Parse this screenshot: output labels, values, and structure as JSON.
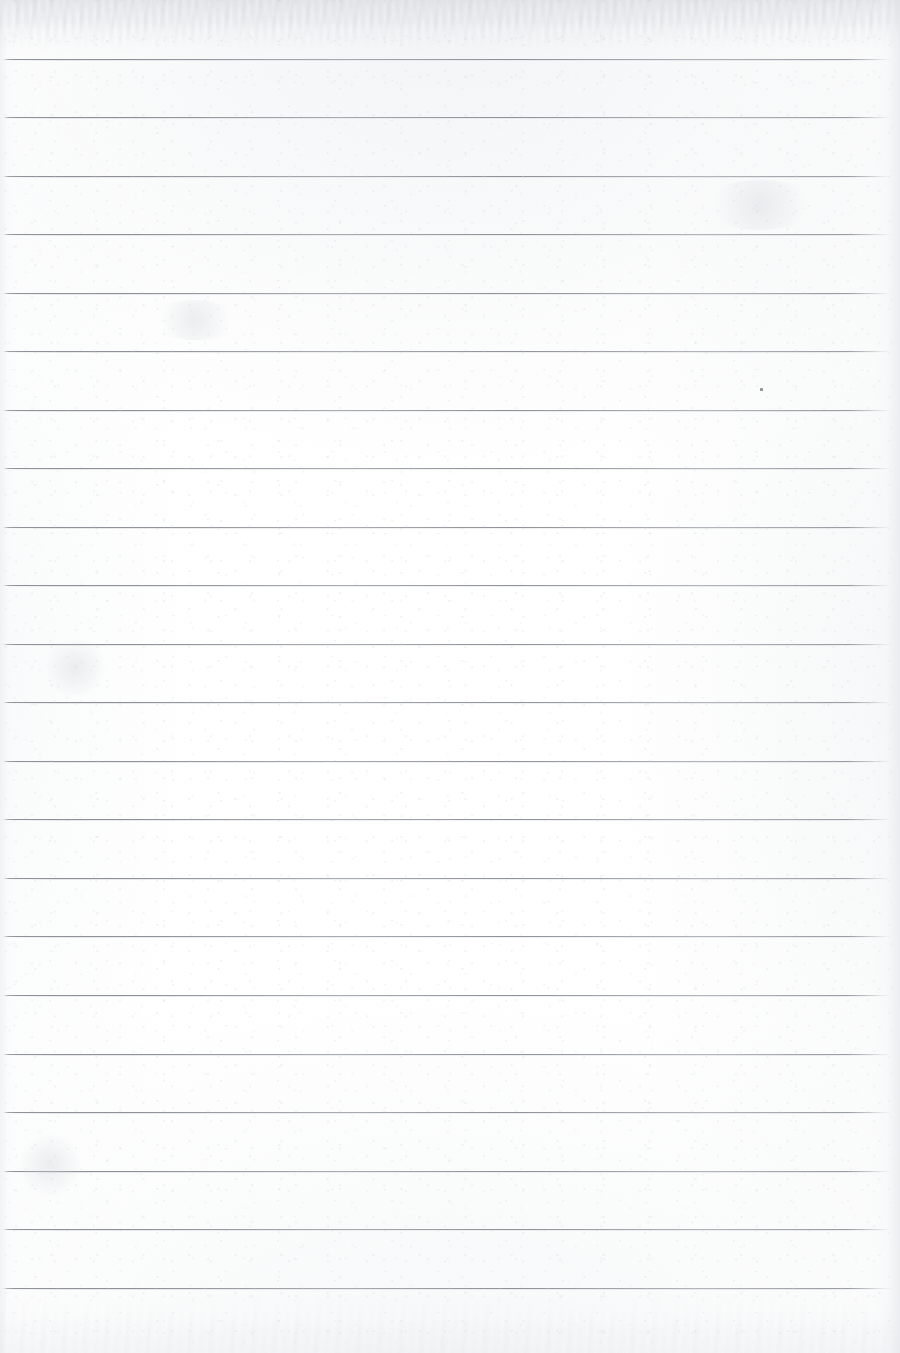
{
  "document": {
    "kind": "scanned-lined-notebook-page",
    "title": "Blank Ruled Notebook Page",
    "content_text": "",
    "has_handwriting": false,
    "has_margin_rule": false,
    "page_width": 900,
    "page_height": 1353
  },
  "colors": {
    "paper": "#ffffff",
    "rule_line": "#82868c",
    "rule_line_soft": "#cdd0d5",
    "edge_shadow": "#dde0e4",
    "speck": "#767a80"
  },
  "ruling": {
    "line_count": 22,
    "first_line_y": 59,
    "line_spacing": 58.5,
    "line_thickness": 1,
    "line_start_x": 3,
    "line_end_x": 892,
    "note": "horizontal ruled lines only; no vertical margin rule"
  },
  "lines": [
    {
      "index": 1,
      "y": 59,
      "x1": 3,
      "x2": 892
    },
    {
      "index": 2,
      "y": 117,
      "x1": 3,
      "x2": 892
    },
    {
      "index": 3,
      "y": 176,
      "x1": 3,
      "x2": 892
    },
    {
      "index": 4,
      "y": 234,
      "x1": 3,
      "x2": 892
    },
    {
      "index": 5,
      "y": 293,
      "x1": 3,
      "x2": 892
    },
    {
      "index": 6,
      "y": 351,
      "x1": 3,
      "x2": 892
    },
    {
      "index": 7,
      "y": 410,
      "x1": 3,
      "x2": 892
    },
    {
      "index": 8,
      "y": 468,
      "x1": 3,
      "x2": 892
    },
    {
      "index": 9,
      "y": 527,
      "x1": 3,
      "x2": 892
    },
    {
      "index": 10,
      "y": 585,
      "x1": 3,
      "x2": 892
    },
    {
      "index": 11,
      "y": 644,
      "x1": 3,
      "x2": 892
    },
    {
      "index": 12,
      "y": 702,
      "x1": 3,
      "x2": 892
    },
    {
      "index": 13,
      "y": 761,
      "x1": 3,
      "x2": 892
    },
    {
      "index": 14,
      "y": 819,
      "x1": 3,
      "x2": 892
    },
    {
      "index": 15,
      "y": 878,
      "x1": 3,
      "x2": 892
    },
    {
      "index": 16,
      "y": 936,
      "x1": 3,
      "x2": 892
    },
    {
      "index": 17,
      "y": 995,
      "x1": 3,
      "x2": 892
    },
    {
      "index": 18,
      "y": 1054,
      "x1": 3,
      "x2": 892
    },
    {
      "index": 19,
      "y": 1112,
      "x1": 3,
      "x2": 892
    },
    {
      "index": 20,
      "y": 1171,
      "x1": 3,
      "x2": 892
    },
    {
      "index": 21,
      "y": 1229,
      "x1": 3,
      "x2": 892
    },
    {
      "index": 22,
      "y": 1288,
      "x1": 3,
      "x2": 892
    }
  ],
  "artifacts": {
    "specks": [
      {
        "name": "scan-speck",
        "x": 760,
        "y": 388,
        "w": 3,
        "h": 3
      }
    ],
    "smudges": [
      {
        "name": "faint-smudge-upper-left",
        "x": 150,
        "y": 300,
        "w": 90,
        "h": 40
      },
      {
        "name": "faint-smudge-mid-left",
        "x": 40,
        "y": 640,
        "w": 70,
        "h": 55
      },
      {
        "name": "faint-smudge-lower-left",
        "x": 20,
        "y": 1130,
        "w": 60,
        "h": 70
      },
      {
        "name": "faint-smudge-upper-right",
        "x": 700,
        "y": 180,
        "w": 120,
        "h": 50
      }
    ],
    "edges": {
      "top_mottle": true,
      "bottom_mottle": true,
      "left_shade": true,
      "right_shade": true
    }
  }
}
